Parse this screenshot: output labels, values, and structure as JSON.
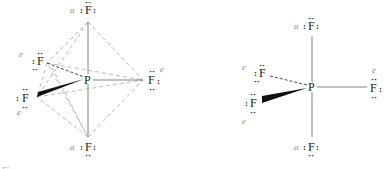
{
  "diagrams": [
    {
      "name": "trigonal-bipyramid-with-edges",
      "center": {
        "symbol": "P"
      },
      "ligands": [
        {
          "symbol": "F",
          "position": "a",
          "role": "axial-top"
        },
        {
          "symbol": "F",
          "position": "a",
          "role": "axial-bottom"
        },
        {
          "symbol": "F",
          "position": "e",
          "role": "equatorial-right"
        },
        {
          "symbol": "F",
          "position": "e",
          "role": "equatorial-back-left"
        },
        {
          "symbol": "F",
          "position": "e",
          "role": "equatorial-front-left"
        }
      ]
    },
    {
      "name": "trigonal-bipyramid-bonds-only",
      "center": {
        "symbol": "P"
      },
      "ligands": [
        {
          "symbol": "F",
          "position": "a",
          "role": "axial-top"
        },
        {
          "symbol": "F",
          "position": "a",
          "role": "axial-bottom"
        },
        {
          "symbol": "F",
          "position": "e",
          "role": "equatorial-right"
        },
        {
          "symbol": "F",
          "position": "e",
          "role": "equatorial-back-left"
        },
        {
          "symbol": "F",
          "position": "e",
          "role": "equatorial-front-left"
        }
      ]
    }
  ],
  "lone_pair": ":",
  "lone_pair_h": "··",
  "caption_fragment": "Fig."
}
